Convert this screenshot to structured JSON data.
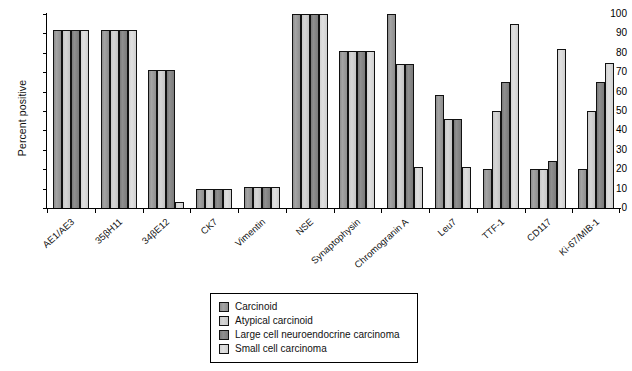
{
  "chart_data": {
    "type": "bar",
    "title": "",
    "xlabel": "",
    "ylabel": "Percent positive",
    "ylim": [
      0,
      100
    ],
    "yticks": [
      0,
      10,
      20,
      30,
      40,
      50,
      60,
      70,
      80,
      90,
      100
    ],
    "grid": false,
    "legend_position": "bottom-center",
    "categories": [
      "AE1/AE3",
      "35βH11",
      "34βE12",
      "CK7",
      "Vimentin",
      "NSE",
      "Synaptophysin",
      "Chromogranin A",
      "Leu7",
      "TTF-1",
      "CD117",
      "Ki-67/MIB-1"
    ],
    "series": [
      {
        "name": "Carcinoid",
        "color": "#9a9a9a",
        "values": [
          92,
          92,
          71,
          10,
          11,
          100,
          81,
          100,
          58,
          20,
          20,
          20
        ]
      },
      {
        "name": "Atypical carcinoid",
        "color": "#cccccc",
        "values": [
          92,
          92,
          71,
          10,
          11,
          100,
          81,
          74,
          46,
          50,
          20,
          50
        ]
      },
      {
        "name": "Large cell neuroendocrine carcinoma",
        "color": "#808080",
        "values": [
          92,
          92,
          71,
          10,
          11,
          100,
          81,
          74,
          46,
          65,
          24,
          65
        ]
      },
      {
        "name": "Small cell carcinoma",
        "color": "#d8d8d8",
        "values": [
          92,
          92,
          3,
          10,
          11,
          100,
          81,
          21,
          21,
          95,
          82,
          75
        ]
      }
    ]
  },
  "legend": {
    "items": [
      "Carcinoid",
      "Atypical carcinoid",
      "Large cell neuroendocrine carcinoma",
      "Small cell carcinoma"
    ]
  }
}
